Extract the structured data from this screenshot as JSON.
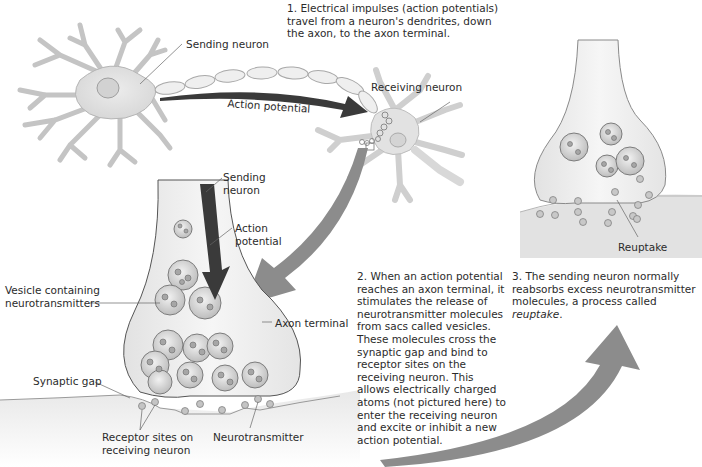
{
  "diagram": {
    "colors": {
      "background": "#ffffff",
      "neuron_fill": "#e6e6e6",
      "neuron_outline": "#b8b8b8",
      "dark_arrow": "#3a3a3a",
      "gray_arrow": "#8c8c8c",
      "text": "#2b2b2b"
    },
    "steps": [
      {
        "number": "1.",
        "text": "Electrical impulses (action potentials) travel from a neuron's dendrites, down the axon, to the axon terminal."
      },
      {
        "number": "2.",
        "text": "When an action potential reaches an axon terminal, it stimulates the release of neurotransmitter molecules from sacs called vesicles. These molecules cross the synaptic gap and bind to receptor sites on the receiving neuron. This allows electrically charged atoms (not pictured here) to enter the receiving neuron and excite or inhibit a new action potential."
      },
      {
        "number": "3.",
        "text_before": "The sending neuron normally reabsorbs excess neurotransmitter molecules, a process called ",
        "text_italic": "reuptake",
        "text_after": "."
      }
    ],
    "panel_top": {
      "labels": {
        "sending_neuron": "Sending neuron",
        "receiving_neuron": "Receiving neuron",
        "action_potential": "Action potential"
      }
    },
    "panel_synapse": {
      "labels": {
        "sending_neuron_1": "Sending",
        "sending_neuron_2": "neuron",
        "action_potential_1": "Action",
        "action_potential_2": "potential",
        "vesicle_1": "Vesicle containing",
        "vesicle_2": "neurotransmitters",
        "axon_terminal": "Axon terminal",
        "synaptic_gap": "Synaptic gap",
        "receptor_1": "Receptor sites on",
        "receptor_2": "receiving neuron",
        "neurotransmitter": "Neurotransmitter"
      }
    },
    "panel_reuptake": {
      "labels": {
        "reuptake": "Reuptake"
      }
    }
  }
}
